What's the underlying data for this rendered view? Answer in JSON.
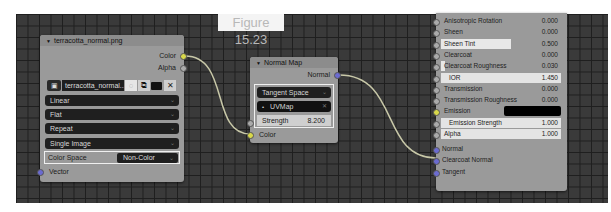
{
  "figure_label": "Figure 15.23",
  "image_node": {
    "title": "terracotta_normal.png",
    "outputs": [
      "Color",
      "Alpha"
    ],
    "image_selector": {
      "image_name": "terracotta_normal...",
      "icons": [
        "image-browse-icon",
        "fake-user-shield-icon",
        "duplicate-icon",
        "open-folder-icon",
        "unlink-icon"
      ]
    },
    "interpolation": "Linear",
    "projection": "Flat",
    "extension": "Repeat",
    "source": "Single Image",
    "color_space_label": "Color Space",
    "color_space_value": "Non-Color",
    "inputs": [
      "Vector"
    ]
  },
  "normal_map_node": {
    "title": "Normal Map",
    "outputs": [
      "Normal"
    ],
    "space": "Tangent Space",
    "uv_map": "UVMap",
    "strength_label": "Strength",
    "strength_value": "8.200",
    "inputs": [
      "Color"
    ]
  },
  "bsdf_node": {
    "rows": [
      {
        "label": "Anisotropic Rotation",
        "value": "0.000"
      },
      {
        "label": "Sheen",
        "value": "0.000"
      },
      {
        "label": "Sheen Tint",
        "value": "0.500"
      },
      {
        "label": "Clearcoat",
        "value": "0.000"
      },
      {
        "label": "Clearcoat Roughness",
        "value": "0.030"
      },
      {
        "label": "IOR",
        "value": "1.450"
      },
      {
        "label": "Transmission",
        "value": "0.000"
      },
      {
        "label": "Transmission Roughness",
        "value": "0.000"
      },
      {
        "label": "Emission",
        "value": ""
      },
      {
        "label": "Emission Strength",
        "value": "1.000"
      },
      {
        "label": "Alpha",
        "value": "1.000"
      }
    ],
    "inputs": [
      "Normal",
      "Clearcoat Normal",
      "Tangent"
    ],
    "emission_color": "#000000"
  },
  "colors": {
    "grid_bg": "#3a3a3a",
    "node_body": "#9a9a9a",
    "dropdown_bg": "#1f1f1f",
    "wire": "#c8c8a8"
  }
}
